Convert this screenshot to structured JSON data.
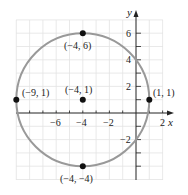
{
  "diagram": {
    "type": "circle-on-coordinate-plane",
    "axes": {
      "x_label": "x",
      "y_label": "y"
    },
    "x_ticks": [
      "−6",
      "−4",
      "−2",
      "2"
    ],
    "y_ticks": [
      "6",
      "4",
      "2",
      "−2"
    ],
    "circle": {
      "center": [
        -4,
        1
      ],
      "radius": 5,
      "color": "#999999"
    },
    "points": [
      {
        "label": "(−4, 6)",
        "x": -4,
        "y": 6
      },
      {
        "label": "(−9, 1)",
        "x": -9,
        "y": 1
      },
      {
        "label": "(−4, 1)",
        "x": -4,
        "y": 1
      },
      {
        "label": "(1, 1)",
        "x": 1,
        "y": 1
      },
      {
        "label": "(−4, −4)",
        "x": -4,
        "y": -4
      }
    ],
    "grid_color": "#e3e3e3"
  }
}
